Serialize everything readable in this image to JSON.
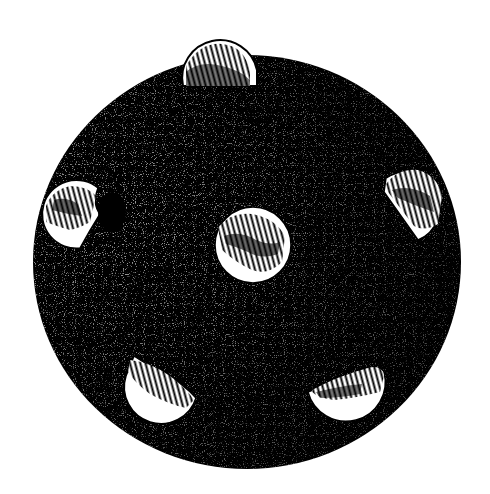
{
  "image": {
    "subject": "dark speckled sphere with white hatched spots",
    "background": "#ffffff",
    "ink": "#000000",
    "paper": "#ffffff"
  },
  "sphere": {
    "cx": 247,
    "cy": 262,
    "rx": 214,
    "ry": 207
  },
  "spots": [
    {
      "name": "spot-top",
      "cx": 220,
      "cy": 58,
      "r": 37,
      "clip": "top-protrude",
      "hatch": "top"
    },
    {
      "name": "spot-center",
      "cx": 253,
      "cy": 245,
      "r": 38,
      "clip": "none",
      "hatch": "top"
    },
    {
      "name": "spot-left",
      "cx": 75,
      "cy": 213,
      "r": 34,
      "clip": "crescent-left",
      "hatch": "left"
    },
    {
      "name": "spot-right",
      "cx": 413,
      "cy": 202,
      "r": 35,
      "clip": "crescent-right",
      "hatch": "top"
    },
    {
      "name": "spot-bottom-left",
      "cx": 160,
      "cy": 385,
      "r": 35,
      "clip": "lower-half",
      "hatch": "top"
    },
    {
      "name": "spot-bottom-right",
      "cx": 346,
      "cy": 390,
      "r": 38,
      "clip": "lower-half",
      "hatch": "top"
    }
  ]
}
